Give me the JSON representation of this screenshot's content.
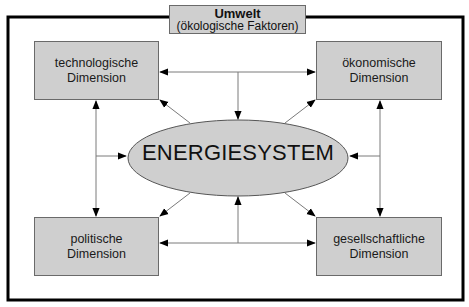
{
  "environment": {
    "title": "Umwelt",
    "subtitle": "(ökologische Faktoren)"
  },
  "center": {
    "label": "ENERGIESYSTEM"
  },
  "dimensions": [
    {
      "position": "top-left",
      "line1": "technologische",
      "line2": "Dimension"
    },
    {
      "position": "top-right",
      "line1": "ökonomische",
      "line2": "Dimension"
    },
    {
      "position": "bottom-left",
      "line1": "politische",
      "line2": "Dimension"
    },
    {
      "position": "bottom-right",
      "line1": "gesellschaftliche",
      "line2": "Dimension"
    }
  ],
  "colors": {
    "box_fill": "#cfcfcf",
    "frame": "#000000",
    "arrow": "#7a7a7a"
  }
}
